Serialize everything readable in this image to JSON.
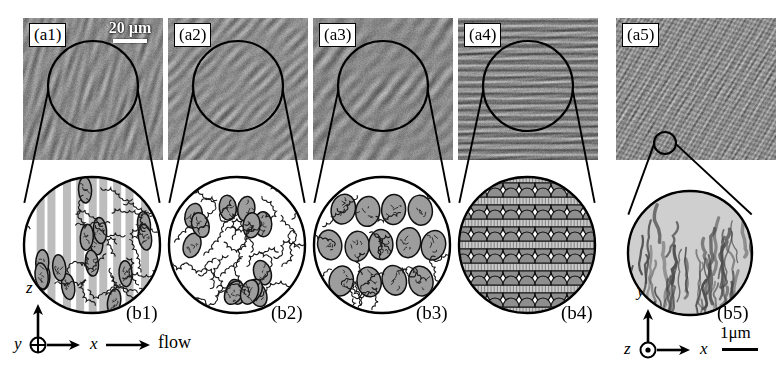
{
  "figure": {
    "title_note": "Flow-induced structure micrographs with schematic insets",
    "top_panels": [
      {
        "label": "(a1)",
        "texture": "fibrillar-vertical",
        "x": 23,
        "y": 18,
        "w": 140,
        "h": 142,
        "circle": {
          "cx": 93,
          "cy": 86,
          "r": 45
        }
      },
      {
        "label": "(a2)",
        "texture": "mottled-isotropic",
        "x": 168,
        "y": 18,
        "w": 140,
        "h": 142,
        "circle": {
          "cx": 238,
          "cy": 86,
          "r": 45
        }
      },
      {
        "label": "(a3)",
        "texture": "coarse-grain",
        "x": 313,
        "y": 18,
        "w": 140,
        "h": 142,
        "circle": {
          "cx": 383,
          "cy": 86,
          "r": 45
        }
      },
      {
        "label": "(a4)",
        "texture": "lamellar-horizontal",
        "x": 458,
        "y": 18,
        "w": 140,
        "h": 142,
        "circle": {
          "cx": 528,
          "cy": 86,
          "r": 45
        }
      },
      {
        "label": "(a5)",
        "texture": "fine-speckle",
        "x": 616,
        "y": 18,
        "w": 160,
        "h": 142,
        "circle": {
          "cx": 665,
          "cy": 143,
          "r": 11
        }
      }
    ],
    "scale_bar_top": {
      "text": "20 µm",
      "x": 98,
      "y": 20,
      "bar_width": 34
    },
    "bottom_panels": [
      {
        "label": "(b1)",
        "cx": 92,
        "cy": 245,
        "r": 68,
        "motif": "aligned-rods-with-coils",
        "label_x": 126,
        "label_y": 303
      },
      {
        "label": "(b2)",
        "cx": 237,
        "cy": 245,
        "r": 68,
        "motif": "dispersed-ellipsoids-with-coils",
        "label_x": 271,
        "label_y": 303
      },
      {
        "label": "(b3)",
        "cx": 382,
        "cy": 245,
        "r": 68,
        "motif": "packed-ellipsoids",
        "label_x": 416,
        "label_y": 303
      },
      {
        "label": "(b4)",
        "cx": 527,
        "cy": 245,
        "r": 68,
        "motif": "layered-stacked-domains",
        "label_x": 561,
        "label_y": 303
      },
      {
        "label": "(b5)",
        "cx": 690,
        "cy": 253,
        "r": 62,
        "motif": "dendritic-streaks",
        "label_x": 717,
        "label_y": 303
      }
    ],
    "axes_left": {
      "vertical_label": "z",
      "out_of_page_label": "y",
      "out_of_page_glyph": "⊕",
      "horizontal_label": "x",
      "flow_label": "flow",
      "origin_x": 38,
      "origin_y": 345
    },
    "axes_right": {
      "vertical_label": "y",
      "out_of_page_label": "z",
      "out_of_page_glyph": "⊙",
      "horizontal_label": "x",
      "scale_text": "1μm",
      "origin_x": 648,
      "origin_y": 350
    },
    "colors": {
      "background": "#ffffff",
      "ink": "#000000",
      "micrograph_mid_gray": "#8a8a8a",
      "schematic_fill": "#b0b0b0",
      "panel_label_bg": "#ffffff"
    }
  }
}
